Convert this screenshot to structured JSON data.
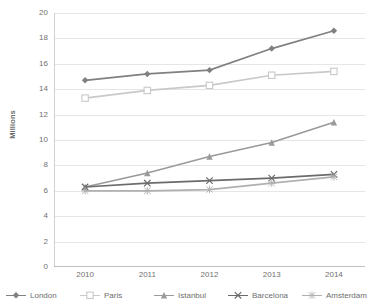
{
  "chart_data": {
    "type": "line",
    "title": "",
    "xlabel": "",
    "ylabel": "Millions",
    "categories": [
      "2010",
      "2011",
      "2012",
      "2013",
      "2014"
    ],
    "ylim": [
      0,
      20
    ],
    "ytick_step": 2,
    "yticks": [
      "20",
      "18",
      "16",
      "14",
      "12",
      "10",
      "8",
      "6",
      "4",
      "2",
      "0"
    ],
    "grid": true,
    "legend_position": "bottom",
    "series": [
      {
        "name": "London",
        "color": "#808080",
        "marker": "diamond",
        "values": [
          14.7,
          15.2,
          15.5,
          17.2,
          18.6
        ]
      },
      {
        "name": "Paris",
        "color": "#c9c9c9",
        "marker": "square",
        "values": [
          13.3,
          13.9,
          14.3,
          15.1,
          15.4
        ]
      },
      {
        "name": "Istanbul",
        "color": "#9a9a9a",
        "marker": "triangle",
        "values": [
          6.3,
          7.4,
          8.7,
          9.8,
          11.4
        ]
      },
      {
        "name": "Barcelona",
        "color": "#6b6b6b",
        "marker": "cross",
        "values": [
          6.3,
          6.6,
          6.8,
          7.0,
          7.3
        ]
      },
      {
        "name": "Amsterdam",
        "color": "#b0b0b0",
        "marker": "star",
        "values": [
          6.0,
          6.0,
          6.1,
          6.6,
          7.1
        ]
      }
    ]
  },
  "legend": {
    "items": [
      {
        "label": "London"
      },
      {
        "label": "Paris"
      },
      {
        "label": "Istanbul"
      },
      {
        "label": "Barcelona"
      },
      {
        "label": "Amsterdam"
      }
    ]
  }
}
